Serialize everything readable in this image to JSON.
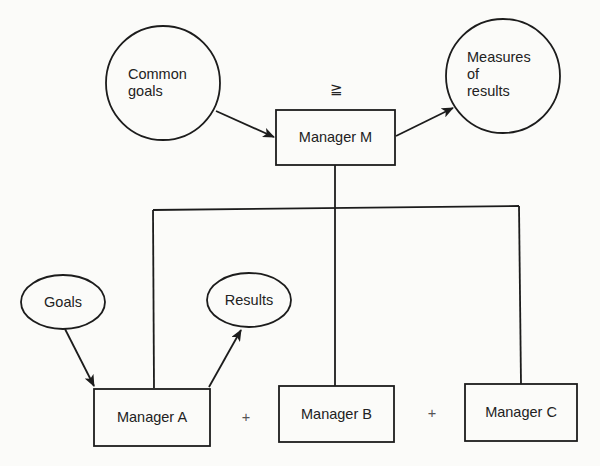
{
  "diagram": {
    "type": "management-by-objectives hierarchy",
    "top": {
      "manager": "Manager M",
      "input": "Common goals",
      "output": "Measures of results",
      "relation_symbol": "≧"
    },
    "subordinates": [
      {
        "manager": "Manager A",
        "input": "Goals",
        "output": "Results"
      },
      {
        "manager": "Manager B"
      },
      {
        "manager": "Manager C"
      }
    ],
    "operators": [
      "+",
      "+"
    ]
  },
  "labels": {
    "common_goals_line1": "Common",
    "common_goals_line2": "goals",
    "measures_line1": "Measures",
    "measures_line2": "of",
    "measures_line3": "results",
    "manager_m": "Manager M",
    "manager_a": "Manager A",
    "manager_b": "Manager B",
    "manager_c": "Manager C",
    "goals": "Goals",
    "results": "Results",
    "geq": "≧",
    "plus_1": "+",
    "plus_2": "+"
  }
}
